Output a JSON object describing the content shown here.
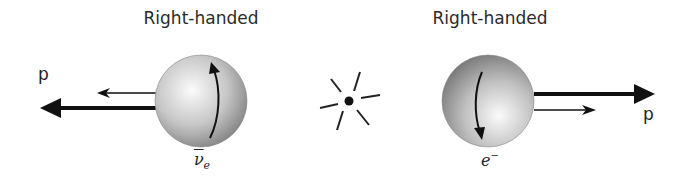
{
  "diagram": {
    "left": {
      "title": "Right-handed",
      "particle_symbol": "ν",
      "particle_subscript": "e",
      "particle_name": "electron antineutrino (ν̄e)",
      "momentum_label": "p",
      "momentum_direction": "left",
      "spin_arrow_direction": "up",
      "spin_direction": "left"
    },
    "center": {
      "vertex": "decay-star"
    },
    "right": {
      "title": "Right-handed",
      "particle_symbol": "e",
      "particle_superscript": "−",
      "particle_name": "electron (e−)",
      "momentum_label": "p",
      "momentum_direction": "right",
      "spin_arrow_direction": "down",
      "spin_direction": "right"
    },
    "colors": {
      "arrow": "#111111",
      "sphere_light": "#f4f4f4",
      "sphere_dark": "#7a7a7a",
      "text": "#222222"
    }
  }
}
